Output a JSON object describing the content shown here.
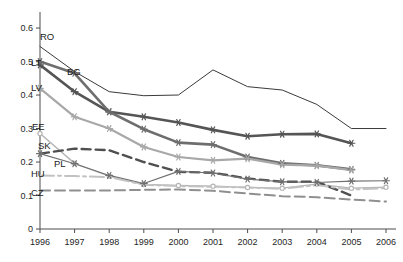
{
  "chart_data": {
    "type": "line",
    "title": "",
    "subtitle": "",
    "xlabel": "",
    "ylabel": "",
    "x": [
      1996,
      1997,
      1998,
      1999,
      2000,
      2001,
      2002,
      2003,
      2004,
      2005,
      2006
    ],
    "xticklabels": [
      "1996",
      "1997",
      "1998",
      "1999",
      "2000",
      "2001",
      "2002",
      "2003",
      "2004",
      "2005",
      "2006"
    ],
    "yticklabels": [
      "0",
      "0.1",
      "0.2",
      "0.3",
      "0.4",
      "0.5",
      "0.6"
    ],
    "yticks": [
      0,
      0.1,
      0.2,
      0.3,
      0.4,
      0.5,
      0.6
    ],
    "xlim": [
      1996,
      2006
    ],
    "ylim": [
      0,
      0.63
    ],
    "grid": false,
    "legend": "inline-left-labels",
    "series": [
      {
        "name": "RO",
        "label": "RO",
        "color": "#3a3a3a",
        "width": 1.0,
        "dash": "none",
        "marker": "none",
        "x": [
          1996,
          1997,
          1998,
          1999,
          2000,
          2001,
          2002,
          2003,
          2004,
          2005,
          2006
        ],
        "values": [
          0.545,
          0.47,
          0.41,
          0.398,
          0.4,
          0.475,
          0.425,
          0.415,
          0.372,
          0.3,
          0.3
        ]
      },
      {
        "name": "LT",
        "label": "LT",
        "color": "#555555",
        "width": 2.6,
        "dash": "none",
        "marker": "star",
        "x": [
          1996,
          1997,
          1998,
          1999,
          2000,
          2001,
          2002,
          2003,
          2004,
          2005
        ],
        "values": [
          0.49,
          0.41,
          0.35,
          0.335,
          0.318,
          0.296,
          0.277,
          0.283,
          0.284,
          0.256
        ]
      },
      {
        "name": "BG",
        "label": "BG",
        "color": "#6e6e6e",
        "width": 2.6,
        "dash": "none",
        "marker": "star",
        "x": [
          1996,
          1997,
          1998,
          1999,
          2000,
          2001,
          2002,
          2003,
          2004,
          2005
        ],
        "values": [
          0.5,
          0.465,
          0.35,
          0.298,
          0.258,
          0.252,
          0.215,
          0.196,
          0.19,
          0.178
        ]
      },
      {
        "name": "LV",
        "label": "LV",
        "color": "#a8a8a8",
        "width": 2.2,
        "dash": "none",
        "marker": "star",
        "x": [
          1996,
          1997,
          1998,
          1999,
          2000,
          2001,
          2002,
          2003,
          2004,
          2005
        ],
        "values": [
          0.42,
          0.335,
          0.3,
          0.245,
          0.215,
          0.205,
          0.21,
          0.192,
          0.189,
          0.176
        ]
      },
      {
        "name": "EE",
        "label": "EE",
        "color": "#b5b5b5",
        "width": 1.4,
        "dash": "none",
        "marker": "circle",
        "x": [
          1996,
          1997,
          1998,
          1999,
          2000,
          2001,
          2002,
          2003,
          2004,
          2005,
          2006
        ],
        "values": [
          0.285,
          0.196,
          0.158,
          0.133,
          0.13,
          0.128,
          0.124,
          0.122,
          0.134,
          0.122,
          0.125
        ]
      },
      {
        "name": "SK",
        "label": "SK",
        "color": "#4f4f4f",
        "width": 2.4,
        "dash": "9,5",
        "marker": "none",
        "x": [
          1996,
          1997,
          1998,
          1999,
          2000,
          2001,
          2002,
          2003,
          2004,
          2005
        ],
        "values": [
          0.225,
          0.24,
          0.235,
          0.2,
          0.171,
          0.168,
          0.151,
          0.141,
          0.141,
          0.1
        ]
      },
      {
        "name": "PL",
        "label": "PL",
        "color": "#707070",
        "width": 1.1,
        "dash": "none",
        "marker": "star",
        "x": [
          1996,
          1997,
          1998,
          1999,
          2000,
          2001,
          2002,
          2003,
          2004,
          2005,
          2006
        ],
        "values": [
          0.225,
          0.195,
          0.16,
          0.136,
          0.172,
          0.167,
          0.149,
          0.141,
          0.139,
          0.143,
          0.144
        ]
      },
      {
        "name": "HU",
        "label": "HU",
        "color": "#c2c2c2",
        "width": 2.0,
        "dash": "14,4,3,4",
        "marker": "none",
        "x": [
          1996,
          1997,
          1998,
          1999,
          2000,
          2001,
          2002,
          2003,
          2004,
          2005,
          2006
        ],
        "values": [
          0.16,
          0.158,
          0.155,
          0.132,
          0.128,
          0.126,
          0.124,
          0.12,
          0.131,
          0.118,
          0.122
        ]
      },
      {
        "name": "CZ",
        "label": "CZ",
        "color": "#8f8f8f",
        "width": 2.0,
        "dash": "10,5",
        "marker": "none",
        "x": [
          1996,
          1997,
          1998,
          1999,
          2000,
          2001,
          2002,
          2003,
          2004,
          2005,
          2006
        ],
        "values": [
          0.115,
          0.115,
          0.115,
          0.117,
          0.118,
          0.114,
          0.106,
          0.098,
          0.095,
          0.088,
          0.082
        ]
      }
    ],
    "series_inline_labels": [
      {
        "name": "RO",
        "x_px": 40,
        "y_px": 40
      },
      {
        "name": "LT",
        "x_px": 31,
        "y_px": 66
      },
      {
        "name": "BG",
        "x_px": 67,
        "y_px": 75
      },
      {
        "name": "LV",
        "x_px": 31,
        "y_px": 91
      },
      {
        "name": "EE",
        "x_px": 32,
        "y_px": 130
      },
      {
        "name": "SK",
        "x_px": 38,
        "y_px": 149
      },
      {
        "name": "PL",
        "x_px": 54,
        "y_px": 167
      },
      {
        "name": "HU",
        "x_px": 31,
        "y_px": 177
      },
      {
        "name": "CZ",
        "x_px": 31,
        "y_px": 196
      }
    ]
  }
}
